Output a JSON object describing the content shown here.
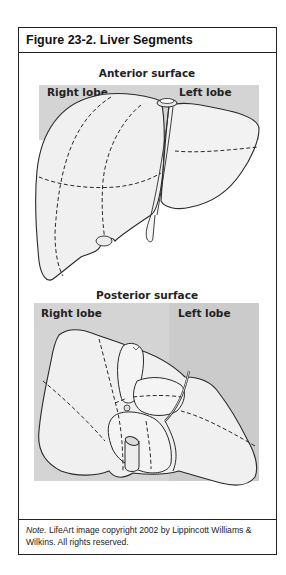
{
  "figure": {
    "title": "Figure 23-2. Liver Segments",
    "anterior": {
      "heading": "Anterior surface",
      "right_label": "Right lobe",
      "left_label": "Left lobe"
    },
    "posterior": {
      "heading": "Posterior surface",
      "right_label": "Right lobe",
      "left_label": "Left lobe"
    },
    "note": {
      "prefix": "Note.",
      "text": " LifeArt image copyright 2002 by Lippincott Williams & Wilkins. All rights reserved."
    }
  },
  "colors": {
    "panel_gray": "#d4d4d4",
    "panel_gray_left": "#cbcbcb",
    "liver_fill": "#f2f2f2",
    "outline": "#2a2a2a"
  }
}
